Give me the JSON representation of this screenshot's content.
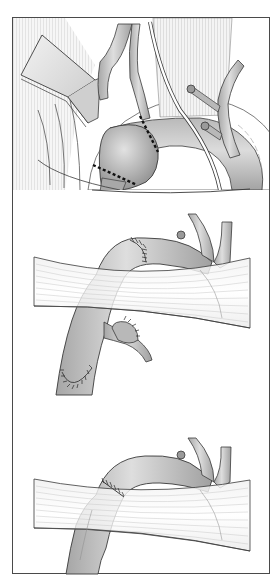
{
  "figure": {
    "title": "",
    "description": "Three-panel surgical illustration of aortic arch aneurysm resection and graft repair",
    "border_color": "#4a4a4a",
    "background": "#ffffff",
    "panels": [
      {
        "id": "panel-1",
        "caption": "",
        "summary": "Saccular aneurysm of the aortic arch exposed with retractor; dashed resection lines marked proximal and distal to the aneurysm; clipped branch vessels and a drain tube visible",
        "elements": [
          "retractor",
          "aneurysm-sac",
          "resection-line-proximal",
          "resection-line-distal",
          "vascular-clip-upper",
          "vascular-clip-lower",
          "drain-tube",
          "branch-vessels",
          "muscle-tissue"
        ]
      },
      {
        "id": "panel-2",
        "caption": "",
        "summary": "Aortic segment passed beneath a tissue band, with sutured proximal anastomosis above and sutured distal end and branch below",
        "elements": [
          "aortic-arch-graft",
          "suture-line-upper",
          "suture-line-lower",
          "branch-patch-sutured",
          "tissue-band",
          "vascular-clip"
        ]
      },
      {
        "id": "panel-3",
        "caption": "",
        "summary": "Completed repair: aortic arch continuous beneath tissue band with single circumferential suture line",
        "elements": [
          "aortic-arch-repaired",
          "suture-line",
          "tissue-band",
          "vascular-clip",
          "branch-vessels"
        ]
      }
    ]
  },
  "palette": {
    "vessel_fill_light": "#e6e6e6",
    "vessel_fill_mid": "#b8b8b8",
    "vessel_fill_dark": "#8f8f8f",
    "outline": "#3a3a3a",
    "tissue_line": "#9a9a9a",
    "suture": "#2a2a2a",
    "dash": "#111111"
  }
}
